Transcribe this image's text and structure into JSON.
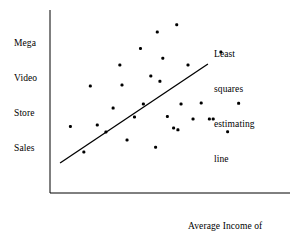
{
  "figure": {
    "background_color": "#ffffff",
    "ink_color": "#000000"
  },
  "labels": {
    "y_axis": {
      "name": "y-axis-label",
      "lines": [
        "Mega",
        "Video",
        "Store",
        "Sales"
      ]
    },
    "x_axis": {
      "name": "x-axis-label",
      "lines": [
        "Average Income of",
        "Renters in Store Area"
      ]
    },
    "annotation": {
      "name": "least-squares-line-annotation",
      "lines": [
        "Least",
        "squares",
        "estimating",
        "line"
      ]
    }
  },
  "chart_data": {
    "type": "scatter",
    "title": "",
    "xlabel": "Average Income of Renters in Store Area",
    "ylabel": "Mega Video Store Sales",
    "grid": false,
    "legend": "none",
    "axes": {
      "style": "L-shaped spine, no tick marks, no tick labels",
      "x_axis_pixel": {
        "x_start": 50,
        "x_end": 290,
        "y": 193
      },
      "y_axis_pixel": {
        "x": 50,
        "y_start": 10,
        "y_end": 193
      },
      "xlim": [
        0,
        1
      ],
      "ylim": [
        0,
        1
      ]
    },
    "points": [
      {
        "x": 0.085,
        "y": 0.364
      },
      {
        "x": 0.141,
        "y": 0.224
      },
      {
        "x": 0.168,
        "y": 0.585
      },
      {
        "x": 0.197,
        "y": 0.372
      },
      {
        "x": 0.233,
        "y": 0.333
      },
      {
        "x": 0.263,
        "y": 0.464
      },
      {
        "x": 0.291,
        "y": 0.7
      },
      {
        "x": 0.3,
        "y": 0.59
      },
      {
        "x": 0.321,
        "y": 0.29
      },
      {
        "x": 0.352,
        "y": 0.415
      },
      {
        "x": 0.377,
        "y": 0.79
      },
      {
        "x": 0.389,
        "y": 0.487
      },
      {
        "x": 0.42,
        "y": 0.64
      },
      {
        "x": 0.44,
        "y": 0.25
      },
      {
        "x": 0.447,
        "y": 0.88
      },
      {
        "x": 0.458,
        "y": 0.61
      },
      {
        "x": 0.47,
        "y": 0.737
      },
      {
        "x": 0.489,
        "y": 0.418
      },
      {
        "x": 0.515,
        "y": 0.355
      },
      {
        "x": 0.528,
        "y": 0.92
      },
      {
        "x": 0.533,
        "y": 0.345
      },
      {
        "x": 0.546,
        "y": 0.487
      },
      {
        "x": 0.575,
        "y": 0.7
      },
      {
        "x": 0.596,
        "y": 0.405
      },
      {
        "x": 0.63,
        "y": 0.492
      },
      {
        "x": 0.664,
        "y": 0.404
      },
      {
        "x": 0.68,
        "y": 0.405
      },
      {
        "x": 0.712,
        "y": 0.77
      },
      {
        "x": 0.74,
        "y": 0.335
      },
      {
        "x": 0.786,
        "y": 0.49
      }
    ],
    "fit_line": {
      "name": "Least squares estimating line",
      "x_start": 0.042,
      "y_start": 0.164,
      "x_end": 0.658,
      "y_end": 0.705
    }
  }
}
